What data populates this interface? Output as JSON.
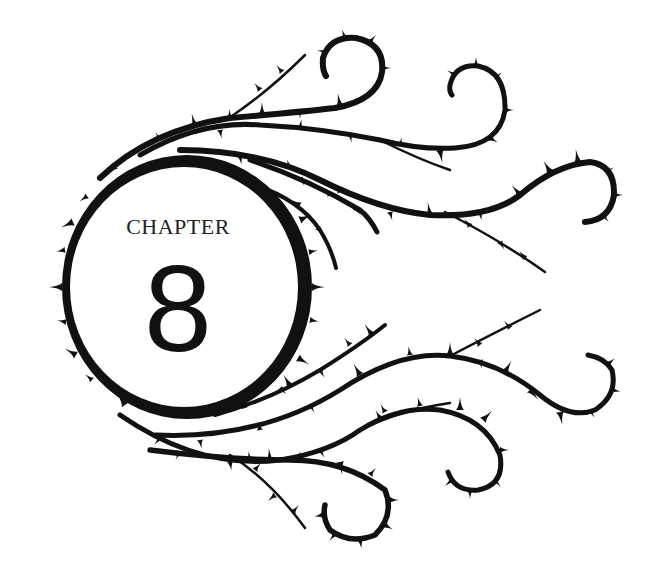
{
  "heading": {
    "label": "CHAPTER",
    "number": "8"
  },
  "ornament": {
    "description": "Thorny vine wreath encircling the chapter number with curling tendrils extending to the right",
    "color": "#111111",
    "background": "#ffffff"
  }
}
